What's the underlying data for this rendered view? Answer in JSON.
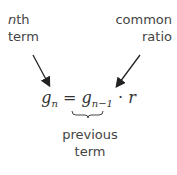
{
  "labels": {
    "nth_term_line1_italic": "n",
    "nth_term_line1_rest": "th",
    "nth_term_line2": "term",
    "common_ratio_line1": "common",
    "common_ratio_line2": "ratio",
    "previous_term_line1": "previous",
    "previous_term_line2": "term"
  },
  "equation": {
    "lhs_var": "g",
    "lhs_sub": "n",
    "equals": "=",
    "rhs_var": "g",
    "rhs_sub": "n−1",
    "dot": "·",
    "ratio_var": "r"
  },
  "colors": {
    "text": "#444444",
    "arrow": "#222222"
  }
}
